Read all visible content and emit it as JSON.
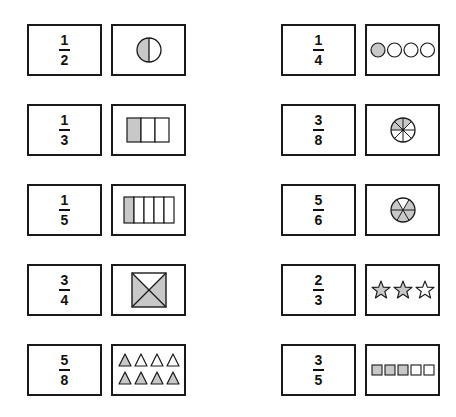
{
  "colors": {
    "shade": "#c8c8c8",
    "stroke": "#1a1a1a",
    "empty": "#ffffff"
  },
  "pairs": [
    {
      "col": "left",
      "row": 0,
      "fraction": {
        "numerator": "1",
        "denominator": "2"
      },
      "picture": {
        "type": "circle-halves",
        "shaded": 1,
        "total": 2
      }
    },
    {
      "col": "left",
      "row": 1,
      "fraction": {
        "numerator": "1",
        "denominator": "3"
      },
      "picture": {
        "type": "bar-segments",
        "shaded": 1,
        "total": 3
      }
    },
    {
      "col": "left",
      "row": 2,
      "fraction": {
        "numerator": "1",
        "denominator": "5"
      },
      "picture": {
        "type": "bar-segments",
        "shaded": 1,
        "total": 5
      }
    },
    {
      "col": "left",
      "row": 3,
      "fraction": {
        "numerator": "3",
        "denominator": "4"
      },
      "picture": {
        "type": "square-quarters",
        "shaded": 3,
        "total": 4
      }
    },
    {
      "col": "left",
      "row": 4,
      "fraction": {
        "numerator": "5",
        "denominator": "8"
      },
      "picture": {
        "type": "triangles",
        "shaded": 5,
        "total": 8
      }
    },
    {
      "col": "right",
      "row": 0,
      "fraction": {
        "numerator": "1",
        "denominator": "4"
      },
      "picture": {
        "type": "circles",
        "shaded": 1,
        "total": 4
      }
    },
    {
      "col": "right",
      "row": 1,
      "fraction": {
        "numerator": "3",
        "denominator": "8"
      },
      "picture": {
        "type": "pie",
        "shaded": 3,
        "total": 8
      }
    },
    {
      "col": "right",
      "row": 2,
      "fraction": {
        "numerator": "5",
        "denominator": "6"
      },
      "picture": {
        "type": "pie",
        "shaded": 5,
        "total": 6
      }
    },
    {
      "col": "right",
      "row": 3,
      "fraction": {
        "numerator": "2",
        "denominator": "3"
      },
      "picture": {
        "type": "stars",
        "shaded": 2,
        "total": 3
      }
    },
    {
      "col": "right",
      "row": 4,
      "fraction": {
        "numerator": "3",
        "denominator": "5"
      },
      "picture": {
        "type": "squares",
        "shaded": 3,
        "total": 5
      }
    }
  ]
}
